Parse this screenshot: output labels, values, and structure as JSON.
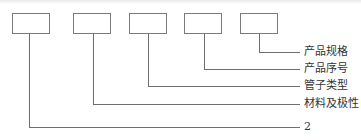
{
  "diagram": {
    "type": "code-structure",
    "colors": {
      "stroke": "#6e6e6e",
      "box_border": "#7a7a7a",
      "text": "#333333",
      "background": "#ffffff"
    },
    "boxes": [
      {
        "index": 1,
        "label": ""
      },
      {
        "index": 2,
        "label": ""
      },
      {
        "index": 3,
        "label": ""
      },
      {
        "index": 4,
        "label": ""
      },
      {
        "index": 5,
        "label": ""
      }
    ],
    "labels": [
      {
        "for_box": 5,
        "text": "产品规格"
      },
      {
        "for_box": 4,
        "text": "产品序号"
      },
      {
        "for_box": 3,
        "text": "管子类型"
      },
      {
        "for_box": 2,
        "text": "材料及极性"
      },
      {
        "for_box": 1,
        "text": "2"
      }
    ]
  }
}
